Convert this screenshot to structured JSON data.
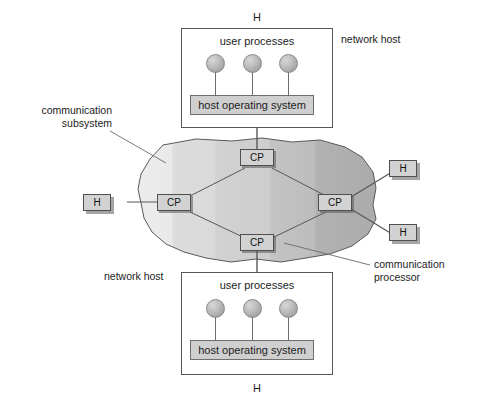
{
  "figure": {
    "background_color": "#ffffff",
    "line_color": "#55565a"
  },
  "top_host": {
    "outer_letter": "H",
    "side_label": "network host",
    "user_processes_label": "user processes",
    "process_count": 3,
    "os_label": "host operating system"
  },
  "bottom_host": {
    "outer_letter": "H",
    "side_label": "network host",
    "user_processes_label": "user processes",
    "process_count": 3,
    "os_label": "host operating system"
  },
  "cloud": {
    "fill_light": "#e6e6e6",
    "fill_mid": "#d4d4d4",
    "fill_dark": "#b4b4b4",
    "outline": "#5a5a5a"
  },
  "nodes": {
    "cp_top": "CP",
    "cp_left": "CP",
    "cp_right": "CP",
    "cp_bottom": "CP",
    "h_left": "H",
    "h_right_upper": "H",
    "h_right_lower": "H"
  },
  "annotations": {
    "subsystem_line1": "communication",
    "subsystem_line2": "subsystem",
    "processor_line1": "communication",
    "processor_line2": "processor"
  }
}
